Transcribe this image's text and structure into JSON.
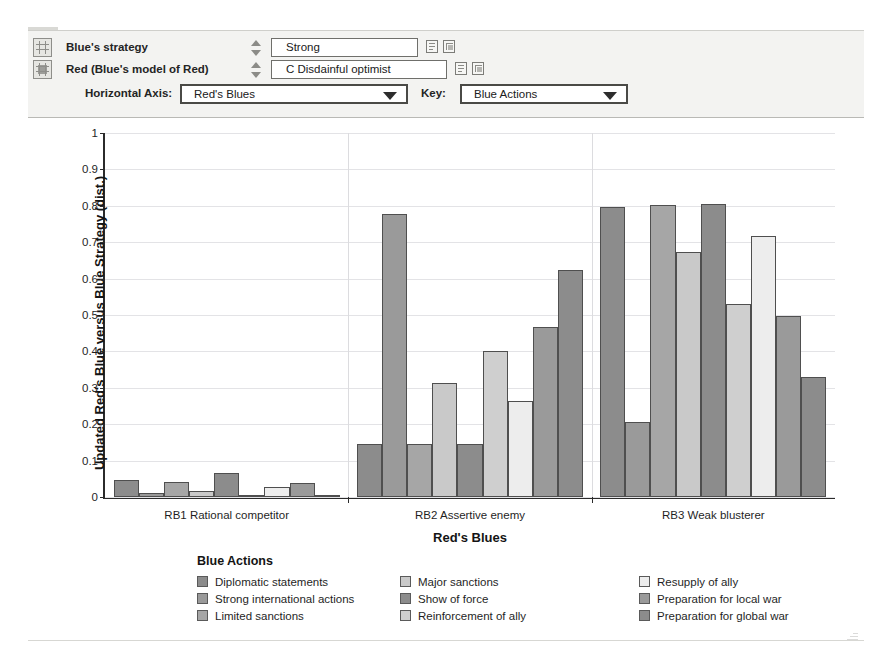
{
  "panel": {
    "rows": [
      {
        "icon": "grid-icon",
        "label": "Blue's strategy",
        "value": "Strong",
        "spinner": "up-down-spinner-icon",
        "tools": [
          "copy-icon",
          "paste-icon"
        ]
      },
      {
        "icon": "grid-filled-icon",
        "label": "Red (Blue's model of Red)",
        "value": "C Disdainful optimist",
        "spinner": "up-down-spinner-icon",
        "tools": [
          "copy-icon",
          "paste-icon"
        ]
      }
    ],
    "selectors": [
      {
        "label": "Horizontal Axis:",
        "value": "Red's Blues"
      },
      {
        "label": "Key:",
        "value": "Blue Actions"
      }
    ]
  },
  "chart_data": {
    "type": "bar",
    "title": "",
    "xlabel": "Red's Blues",
    "ylabel": "Updated Red's Blue versus Blue Strategy (dist.)",
    "ylim": [
      0,
      1
    ],
    "yticks": [
      "0",
      "0.1",
      "0.2",
      "0.3",
      "0.4",
      "0.5",
      "0.6",
      "0.7",
      "0.8",
      "0.9",
      "1"
    ],
    "grid": true,
    "legend_title": "Blue Actions",
    "legend_position": "bottom",
    "categories": [
      "RB1 Rational competitor",
      "RB2 Assertive enemy",
      "RB3 Weak blusterer"
    ],
    "series": [
      {
        "name": "Diplomatic statements",
        "color": "#8c8c8c",
        "values": [
          0.048,
          0.146,
          0.797
        ]
      },
      {
        "name": "Strong international actions",
        "color": "#9a9a9a",
        "values": [
          0.012,
          0.778,
          0.205
        ]
      },
      {
        "name": "Limited sanctions",
        "color": "#a6a6a6",
        "values": [
          0.04,
          0.147,
          0.801
        ]
      },
      {
        "name": "Major sanctions",
        "color": "#c9c9c9",
        "values": [
          0.017,
          0.313,
          0.672
        ]
      },
      {
        "name": "Show of force",
        "color": "#8c8c8c",
        "values": [
          0.066,
          0.146,
          0.806
        ]
      },
      {
        "name": "Reinforcement of ally",
        "color": "#cfcfcf",
        "values": [
          0.005,
          0.4,
          0.53
        ]
      },
      {
        "name": "Resupply of ally",
        "color": "#ededed",
        "values": [
          0.028,
          0.265,
          0.716
        ]
      },
      {
        "name": "Preparation for local war",
        "color": "#9a9a9a",
        "values": [
          0.039,
          0.466,
          0.497
        ]
      },
      {
        "name": "Preparation for global war",
        "color": "#8c8c8c",
        "values": [
          0.002,
          0.625,
          0.331
        ]
      }
    ]
  }
}
